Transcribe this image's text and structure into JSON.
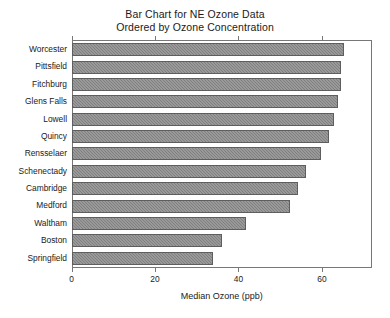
{
  "chart_data": {
    "type": "bar",
    "orientation": "horizontal",
    "title": "Bar Chart for NE Ozone Data",
    "subtitle": "Ordered by Ozone Concentration",
    "title_lines": [
      "Bar Chart for NE Ozone Data",
      "Ordered by Ozone Concentration"
    ],
    "xlabel": "Median Ozone (ppb)",
    "ylabel": "",
    "categories": [
      "Worcester",
      "Pittsfield",
      "Fitchburg",
      "Glens Falls",
      "Lowell",
      "Quincy",
      "Rensselaer",
      "Schenectady",
      "Cambridge",
      "Medford",
      "Waltham",
      "Boston",
      "Springfield"
    ],
    "values": [
      65.5,
      64.8,
      64.7,
      64.0,
      63.0,
      62.0,
      60.0,
      56.3,
      54.5,
      52.5,
      42.0,
      36.0,
      34.0
    ],
    "xlim": [
      0,
      72
    ],
    "xticks": [
      0,
      20,
      40,
      60
    ],
    "xticklabels": [
      "0",
      "20",
      "40",
      "60"
    ],
    "grid": false,
    "legend": false,
    "bar_fill_color": "#808080",
    "bar_edge_color": "#5e5e5e",
    "axis_color": "#777777",
    "text_color": "#1a1a1a",
    "background_color": "#ffffff"
  }
}
